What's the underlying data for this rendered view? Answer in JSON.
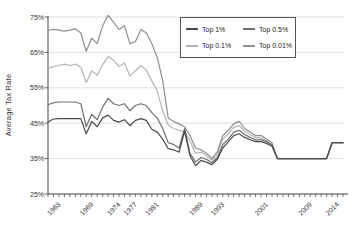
{
  "figure": {
    "kind": "statistical line chart",
    "background": "#fefefe"
  },
  "chart_data": {
    "type": "line",
    "title": "",
    "xlabel": "",
    "ylabel": "Average Tax Rate",
    "xlim": [
      1961,
      2015
    ],
    "ylim": [
      25,
      75
    ],
    "yticks": [
      25,
      35,
      45,
      55,
      65,
      75
    ],
    "ytick_suffix": "%",
    "x_labeled_ticks": [
      1963,
      1969,
      1974,
      1977,
      1981,
      1989,
      1993,
      2001,
      2009,
      2014
    ],
    "grid": "horizontal",
    "legend_position": "top-right-inside",
    "axis_color": "#444444",
    "grid_color": "#d9d9d9",
    "x": [
      1961,
      1962,
      1963,
      1964,
      1965,
      1966,
      1967,
      1968,
      1969,
      1970,
      1971,
      1972,
      1973,
      1974,
      1975,
      1976,
      1977,
      1978,
      1979,
      1980,
      1981,
      1982,
      1983,
      1984,
      1985,
      1986,
      1987,
      1988,
      1989,
      1990,
      1991,
      1992,
      1993,
      1994,
      1995,
      1996,
      1997,
      1998,
      1999,
      2000,
      2001,
      2002,
      2003,
      2004,
      2005,
      2006,
      2007,
      2008,
      2009,
      2010,
      2011,
      2012,
      2013,
      2014,
      2015
    ],
    "series": [
      {
        "name": "Top 1%",
        "color": "#4a4a4a",
        "values": [
          45.3,
          46.2,
          46.3,
          46.3,
          46.3,
          46.3,
          46.3,
          42.0,
          45.5,
          44.0,
          46.5,
          47.3,
          45.8,
          45.3,
          46.0,
          44.3,
          45.8,
          46.3,
          45.8,
          43.3,
          42.5,
          40.5,
          37.8,
          37.5,
          36.8,
          42.8,
          35.8,
          33.0,
          34.5,
          34.0,
          33.3,
          34.8,
          38.0,
          39.8,
          41.5,
          42.0,
          41.0,
          40.3,
          39.8,
          39.8,
          39.3,
          38.5,
          35.0,
          35.0,
          35.0,
          35.0,
          35.0,
          35.0,
          35.0,
          35.0,
          35.0,
          35.0,
          39.5,
          39.5,
          39.5
        ]
      },
      {
        "name": "Top 0.5%",
        "color": "#6f6f6f",
        "values": [
          50.2,
          50.8,
          51.0,
          51.0,
          51.0,
          51.0,
          50.5,
          44.0,
          47.5,
          46.0,
          49.5,
          52.0,
          50.5,
          50.0,
          50.5,
          48.5,
          50.0,
          50.5,
          50.0,
          48.0,
          46.5,
          43.5,
          39.5,
          39.0,
          38.0,
          43.5,
          36.5,
          34.0,
          35.3,
          34.8,
          33.8,
          35.3,
          39.0,
          40.5,
          42.5,
          43.0,
          41.8,
          41.0,
          40.3,
          40.3,
          39.8,
          38.8,
          35.0,
          35.0,
          35.0,
          35.0,
          35.0,
          35.0,
          35.0,
          35.0,
          35.0,
          35.0,
          39.5,
          39.5,
          39.5
        ]
      },
      {
        "name": "Top 0.1%",
        "color": "#b4b4b4",
        "values": [
          60.5,
          61.0,
          61.3,
          61.7,
          61.3,
          61.7,
          60.8,
          56.5,
          59.8,
          58.5,
          61.5,
          63.8,
          62.8,
          61.0,
          62.0,
          58.3,
          59.8,
          61.3,
          60.0,
          57.0,
          54.0,
          48.5,
          44.5,
          43.5,
          43.0,
          42.5,
          40.0,
          36.5,
          36.8,
          35.8,
          34.5,
          36.3,
          40.5,
          42.0,
          43.8,
          44.3,
          42.8,
          41.8,
          41.0,
          40.8,
          40.0,
          39.0,
          35.0,
          35.0,
          35.0,
          35.0,
          35.0,
          35.0,
          35.0,
          35.0,
          35.0,
          35.0,
          39.5,
          39.5,
          39.5
        ]
      },
      {
        "name": "Top 0.01%",
        "color": "#8e8e8e",
        "values": [
          71.2,
          71.5,
          71.3,
          71.0,
          71.3,
          71.7,
          70.5,
          65.3,
          69.0,
          67.5,
          72.5,
          75.5,
          73.5,
          71.5,
          72.5,
          67.5,
          68.0,
          71.5,
          70.5,
          67.5,
          63.5,
          57.0,
          46.5,
          45.5,
          44.8,
          44.0,
          41.5,
          38.0,
          37.5,
          36.5,
          35.0,
          37.0,
          41.5,
          43.0,
          44.8,
          45.5,
          43.5,
          42.5,
          41.5,
          41.5,
          40.5,
          39.5,
          35.0,
          35.0,
          35.0,
          35.0,
          35.0,
          35.0,
          35.0,
          35.0,
          35.0,
          35.0,
          39.5,
          39.5,
          39.5
        ]
      }
    ]
  }
}
